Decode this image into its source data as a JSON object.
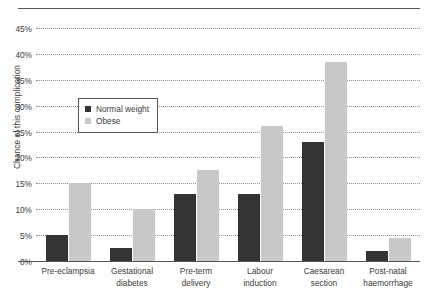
{
  "chart_data": {
    "type": "bar",
    "title": "",
    "xlabel": "",
    "ylabel": "Chance of this complication",
    "ylim": [
      0,
      45
    ],
    "ytick_labels": [
      "0%",
      "5%",
      "10%",
      "15%",
      "20%",
      "25%",
      "30%",
      "35%",
      "40%",
      "45%"
    ],
    "ytick_values": [
      0,
      5,
      10,
      15,
      20,
      25,
      30,
      35,
      40,
      45
    ],
    "grid": true,
    "legend_position": "upper-left-inside",
    "categories": [
      "Pre-eclampsia",
      "Gestational diabetes",
      "Pre-term delivery",
      "Labour induction",
      "Caesarean section",
      "Post-natal haemorrhage"
    ],
    "category_lines": [
      [
        "Pre-eclampsia"
      ],
      [
        "Gestational",
        "diabetes"
      ],
      [
        "Pre-term",
        "delivery"
      ],
      [
        "Labour",
        "induction"
      ],
      [
        "Caesarean",
        "section"
      ],
      [
        "Post-natal",
        "haemorrhage"
      ]
    ],
    "series": [
      {
        "name": "Normal weight",
        "color": "#333333",
        "values": [
          5.0,
          2.5,
          13.0,
          13.0,
          23.0,
          2.0
        ]
      },
      {
        "name": "Obese",
        "color": "#c8c8c8",
        "values": [
          15.0,
          10.0,
          17.5,
          26.0,
          38.5,
          4.5
        ]
      }
    ]
  },
  "axis": {
    "ylabel": "Chance of this complication"
  },
  "legend": {
    "entries": [
      {
        "label": "Normal weight",
        "color": "#333333"
      },
      {
        "label": "Obese",
        "color": "#c8c8c8"
      }
    ]
  }
}
